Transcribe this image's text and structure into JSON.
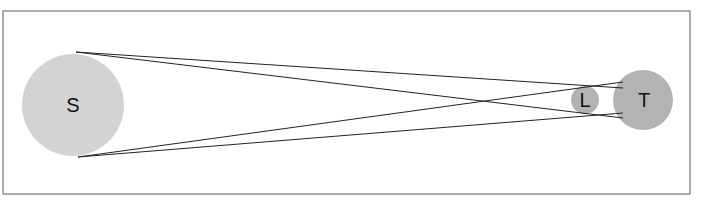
{
  "diagram": {
    "type": "eclipse-geometry",
    "bodies": [
      {
        "id": "sun",
        "label": "S",
        "color": "#d3d3d3"
      },
      {
        "id": "moon",
        "label": "L",
        "color": "#b3b3b3"
      },
      {
        "id": "earth",
        "label": "T",
        "color": "#b3b3b3"
      }
    ],
    "line_color": "#222222",
    "frame_color": "#777777"
  }
}
